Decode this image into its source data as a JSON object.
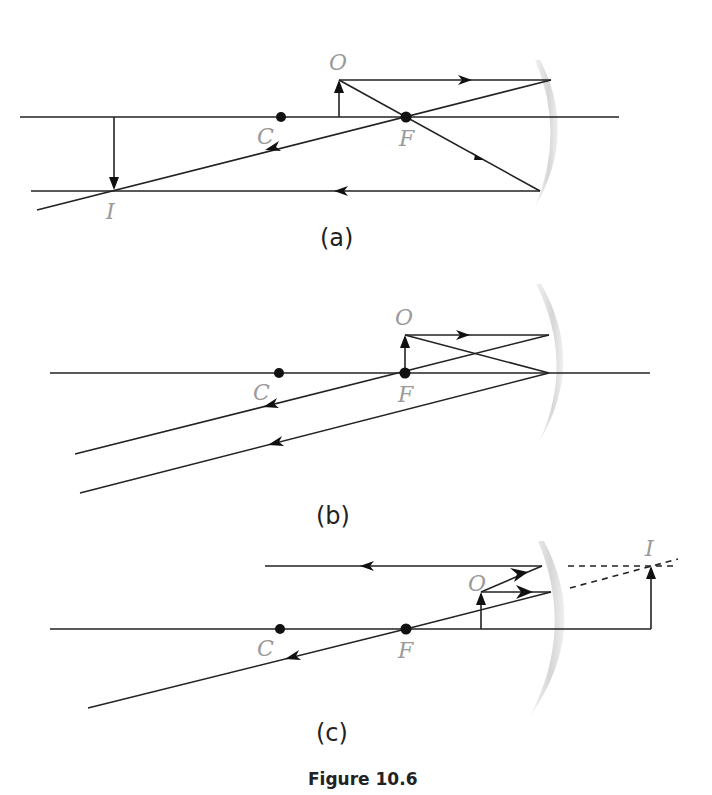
{
  "figure": {
    "caption": "Figure 10.6"
  },
  "panels": [
    {
      "id": "a",
      "label": "(a)",
      "point_labels": {
        "center": "C",
        "focus": "F",
        "object": "O",
        "image": "I"
      },
      "description": "Object between C and F; real inverted magnified image beyond C"
    },
    {
      "id": "b",
      "label": "(b)",
      "point_labels": {
        "center": "C",
        "focus": "F",
        "object": "O"
      },
      "description": "Object at F; reflected rays parallel, image at infinity"
    },
    {
      "id": "c",
      "label": "(c)",
      "point_labels": {
        "center": "C",
        "focus": "F",
        "object": "O",
        "image": "I"
      },
      "description": "Object between F and mirror; virtual upright magnified image behind mirror"
    }
  ],
  "colors": {
    "ray": "#222222",
    "label": "#9a9a9a",
    "mirror": "#d8d8d8"
  }
}
